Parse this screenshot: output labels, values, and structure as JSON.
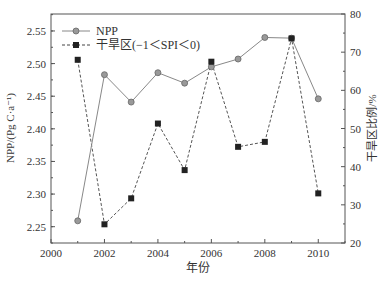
{
  "chart_data": {
    "type": "line",
    "title": "",
    "xlabel": "年份",
    "ylabel": "NPP/(Pg C·a⁻¹)",
    "y2label": "干旱区比例/%",
    "x": [
      2001,
      2002,
      2003,
      2004,
      2005,
      2006,
      2007,
      2008,
      2009,
      2010
    ],
    "xlim": [
      2000,
      2011
    ],
    "xticks": [
      "2000",
      "2002",
      "2004",
      "2006",
      "2008",
      "2010"
    ],
    "ylim": [
      2.225,
      2.576
    ],
    "yticks": [
      "2.25",
      "2.30",
      "2.35",
      "2.40",
      "2.45",
      "2.50",
      "2.55"
    ],
    "y2lim": [
      20,
      80
    ],
    "y2ticks": [
      "20",
      "30",
      "40",
      "50",
      "60",
      "70",
      "80"
    ],
    "grid": false,
    "legend_position": "upper left",
    "series": [
      {
        "name": "NPP",
        "axis": "left",
        "style": "solid line, circle markers",
        "color": "#888888",
        "values": [
          2.259,
          2.483,
          2.441,
          2.486,
          2.47,
          2.495,
          2.507,
          2.54,
          2.539,
          2.446
        ]
      },
      {
        "name": "干旱区(−1＜SPI＜0)",
        "axis": "right",
        "style": "dashed line, square markers",
        "color": "#333333",
        "values": [
          68.0,
          24.9,
          31.7,
          51.3,
          39.1,
          67.5,
          45.2,
          46.5,
          73.6,
          33.0
        ]
      }
    ]
  }
}
